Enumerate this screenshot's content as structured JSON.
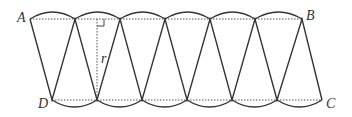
{
  "diagram": {
    "labels": {
      "A": "A",
      "B": "B",
      "C": "C",
      "D": "D",
      "radius": "r"
    },
    "colors": {
      "stroke": "#333333",
      "dotted": "#555555"
    },
    "sectors_up": 6,
    "sectors_down": 6
  }
}
